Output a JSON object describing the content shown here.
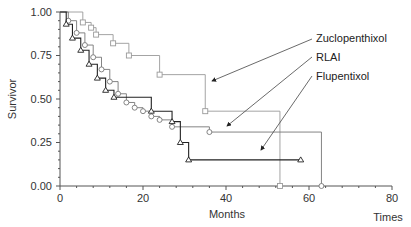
{
  "chart_data": {
    "type": "line",
    "subtype": "kaplan-meier-step",
    "title": "",
    "xlabel": "Months",
    "xlabel_secondary": "Times",
    "ylabel": "Survivor",
    "xlim": [
      0,
      80
    ],
    "ylim": [
      0,
      1
    ],
    "x_ticks": [
      "0",
      "20",
      "40",
      "60",
      "80"
    ],
    "y_ticks": [
      "0.00",
      "0.25",
      "0.50",
      "0.75",
      "1.00"
    ],
    "grid": false,
    "legend_position": "right, annotated with arrows",
    "series": [
      {
        "name": "Zuclopenthixol",
        "marker": "square",
        "color": "#9a9a9a",
        "x": [
          0,
          5.5,
          7.5,
          8.7,
          12.8,
          16.6,
          24,
          35,
          53
        ],
        "y": [
          1.0,
          0.94,
          0.91,
          0.87,
          0.82,
          0.75,
          0.64,
          0.43,
          0.0
        ]
      },
      {
        "name": "RLAI",
        "marker": "circle",
        "color": "#777777",
        "x": [
          0,
          2,
          4,
          6,
          8,
          10,
          12,
          14,
          16,
          18,
          20,
          22,
          24,
          27,
          36,
          63
        ],
        "y": [
          1.0,
          0.95,
          0.88,
          0.81,
          0.74,
          0.67,
          0.6,
          0.53,
          0.48,
          0.45,
          0.43,
          0.4,
          0.38,
          0.34,
          0.31,
          0.0
        ]
      },
      {
        "name": "Flupentixol",
        "marker": "triangle",
        "color": "#222222",
        "x": [
          0,
          1.5,
          3,
          5,
          7,
          9,
          11,
          13,
          22,
          27,
          29,
          31,
          58
        ],
        "y": [
          1.0,
          0.93,
          0.85,
          0.78,
          0.7,
          0.62,
          0.55,
          0.51,
          0.43,
          0.37,
          0.25,
          0.15,
          0.15
        ]
      }
    ]
  },
  "labels": {
    "ylabel": "Survivor",
    "xlabel": "Months",
    "xlabel_secondary": "Times",
    "legend": [
      "Zuclopenthixol",
      "RLAI",
      "Flupentixol"
    ],
    "x_ticks": [
      "0",
      "20",
      "40",
      "60",
      "80"
    ],
    "y_ticks": [
      "0.00",
      "0.25",
      "0.50",
      "0.75",
      "1.00"
    ]
  }
}
